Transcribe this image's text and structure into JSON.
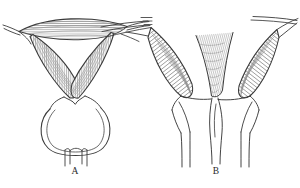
{
  "figure": {
    "kind": "anatomical-line-drawing",
    "medium": "pen-and-ink hatched line art",
    "background_color": "#ffffff",
    "ink_color": "#3a3a3a",
    "hatch_color": "#8b8b8b",
    "canvas": {
      "width": 300,
      "height": 188
    },
    "panels": [
      {
        "id": "A",
        "label": "A",
        "label_position": {
          "x": 75,
          "y": 173
        },
        "subject": "normal uterus with fallopian tubes and rounded lower structure",
        "description": "Lens-shaped hatched fundus at top spanning the full panel width, two hatched horns converging downward in a V into a narrow neck, a large rounded sac below, and two short tubes descending from its base.",
        "parts": [
          {
            "name": "fundus",
            "shading": "horizontal hatching"
          },
          {
            "name": "left-tube",
            "shading": "outline"
          },
          {
            "name": "right-tube",
            "shading": "outline"
          },
          {
            "name": "left-horn",
            "shading": "vertical hatching"
          },
          {
            "name": "right-horn",
            "shading": "vertical hatching"
          },
          {
            "name": "neck",
            "shading": "outline"
          },
          {
            "name": "rounded-sac",
            "shading": "outline"
          },
          {
            "name": "left-outlet",
            "shading": "outline"
          },
          {
            "name": "right-outlet",
            "shading": "outline"
          }
        ]
      },
      {
        "id": "B",
        "label": "B",
        "label_position": {
          "x": 216,
          "y": 173
        },
        "subject": "bicornuate / duplex uterus with divided lower canal",
        "description": "Two large hatched wing-shaped horns splayed outward and upward with a deep central cleft between them, narrowing to a point, opening into a funnel that divides into two parallel descending canals.",
        "parts": [
          {
            "name": "left-wing",
            "shading": "dense oblique hatching"
          },
          {
            "name": "right-wing",
            "shading": "dense oblique hatching"
          },
          {
            "name": "left-tube",
            "shading": "outline"
          },
          {
            "name": "right-tube",
            "shading": "outline"
          },
          {
            "name": "central-cleft",
            "shading": "converging hatch lines"
          },
          {
            "name": "funnel",
            "shading": "outline"
          },
          {
            "name": "left-canal",
            "shading": "outline"
          },
          {
            "name": "right-canal",
            "shading": "outline"
          },
          {
            "name": "septum",
            "shading": "outline"
          }
        ]
      }
    ]
  }
}
